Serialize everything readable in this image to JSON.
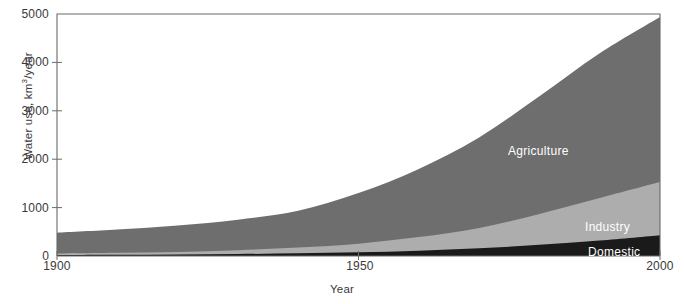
{
  "chart_data": {
    "type": "area",
    "stacked": true,
    "title": "",
    "xlabel": "Year",
    "ylabel": "Water use, km3/year",
    "ylabel_parts": {
      "pre": "Water use, km",
      "sup": "3",
      "post": "/year"
    },
    "xlim": [
      1900,
      2000
    ],
    "ylim": [
      0,
      5000
    ],
    "xticks": [
      1900,
      1950,
      2000
    ],
    "xtick_labels": [
      "1900",
      "1950",
      "2000"
    ],
    "yticks": [
      0,
      1000,
      2000,
      3000,
      4000,
      5000
    ],
    "ytick_labels": [
      "0",
      "1000",
      "2000",
      "3000",
      "4000",
      "5000"
    ],
    "grid": false,
    "legend_position": "inline-right",
    "x": [
      1900,
      1910,
      1920,
      1930,
      1940,
      1950,
      1960,
      1970,
      1980,
      1990,
      2000
    ],
    "series": [
      {
        "name": "Domestic",
        "color": "#1a1a1a",
        "label": "Domestic",
        "values": [
          20,
          25,
          30,
          40,
          55,
          75,
          110,
          160,
          230,
          320,
          430
        ]
      },
      {
        "name": "Industry",
        "color": "#adadad",
        "label": "Industry",
        "values": [
          30,
          40,
          55,
          80,
          120,
          180,
          280,
          420,
          640,
          880,
          1100
        ]
      },
      {
        "name": "Agriculture",
        "color": "#6e6e6e",
        "label": "Agriculture",
        "values": [
          430,
          480,
          545,
          630,
          760,
          1045,
          1410,
          1870,
          2430,
          2990,
          3410
        ]
      }
    ],
    "totals": [
      480,
      545,
      630,
      750,
      935,
      1300,
      1800,
      2450,
      3300,
      4190,
      4940
    ],
    "annotations": [
      {
        "text": "Agriculture",
        "x_px": 508,
        "y_px": 144
      },
      {
        "text": "Industry",
        "x_px": 585,
        "y_px": 227
      },
      {
        "text": "Domestic",
        "x_px": 590,
        "y_px": 253
      }
    ],
    "axis_color": "#6b6b6b",
    "plot_box": {
      "left": 57,
      "top": 14,
      "right": 660,
      "bottom": 256
    }
  }
}
